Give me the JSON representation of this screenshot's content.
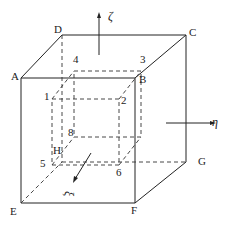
{
  "diagram": {
    "type": "nested-cube-coordinate-diagram",
    "outer_vertices": {
      "A": "A",
      "B": "B",
      "C": "C",
      "D": "D",
      "E": "E",
      "F": "F",
      "G": "G",
      "H": "H"
    },
    "inner_vertices": {
      "v1": "1",
      "v2": "2",
      "v3": "3",
      "v4": "4",
      "v5": "5",
      "v6": "6",
      "v8": "8"
    },
    "axes": {
      "zeta": "ζ",
      "eta": "η",
      "xi": "ξ"
    }
  }
}
